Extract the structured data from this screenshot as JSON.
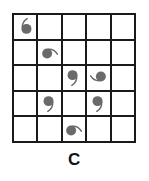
{
  "figure": {
    "caption": "C",
    "rows": 5,
    "cols": 5,
    "grid_line_color": "#1a1a1a",
    "glyph_color": "#6a6a6a",
    "background_color": "#ffffff"
  },
  "cells": [
    {
      "row": 1,
      "col": 1,
      "glyph": "comma-mark",
      "rotation": 180,
      "label": "comma rotated 180 degrees"
    },
    {
      "row": 1,
      "col": 2,
      "glyph": "",
      "rotation": 0,
      "label": "empty"
    },
    {
      "row": 1,
      "col": 3,
      "glyph": "",
      "rotation": 0,
      "label": "empty"
    },
    {
      "row": 1,
      "col": 4,
      "glyph": "",
      "rotation": 0,
      "label": "empty"
    },
    {
      "row": 1,
      "col": 5,
      "glyph": "",
      "rotation": 0,
      "label": "empty"
    },
    {
      "row": 2,
      "col": 1,
      "glyph": "",
      "rotation": 0,
      "label": "empty"
    },
    {
      "row": 2,
      "col": 2,
      "glyph": "comma-mark",
      "rotation": 270,
      "label": "comma rotated 270 degrees"
    },
    {
      "row": 2,
      "col": 3,
      "glyph": "",
      "rotation": 0,
      "label": "empty"
    },
    {
      "row": 2,
      "col": 4,
      "glyph": "",
      "rotation": 0,
      "label": "empty"
    },
    {
      "row": 2,
      "col": 5,
      "glyph": "",
      "rotation": 0,
      "label": "empty"
    },
    {
      "row": 3,
      "col": 1,
      "glyph": "",
      "rotation": 0,
      "label": "empty"
    },
    {
      "row": 3,
      "col": 2,
      "glyph": "",
      "rotation": 0,
      "label": "empty"
    },
    {
      "row": 3,
      "col": 3,
      "glyph": "comma-mark",
      "rotation": 0,
      "label": "comma upright"
    },
    {
      "row": 3,
      "col": 4,
      "glyph": "comma-mark",
      "rotation": 90,
      "label": "comma rotated 90 degrees"
    },
    {
      "row": 3,
      "col": 5,
      "glyph": "",
      "rotation": 0,
      "label": "empty"
    },
    {
      "row": 4,
      "col": 1,
      "glyph": "",
      "rotation": 0,
      "label": "empty"
    },
    {
      "row": 4,
      "col": 2,
      "glyph": "comma-mark",
      "rotation": 0,
      "label": "comma upright"
    },
    {
      "row": 4,
      "col": 3,
      "glyph": "",
      "rotation": 0,
      "label": "empty"
    },
    {
      "row": 4,
      "col": 4,
      "glyph": "comma-mark",
      "rotation": 0,
      "label": "comma upright"
    },
    {
      "row": 4,
      "col": 5,
      "glyph": "",
      "rotation": 0,
      "label": "empty"
    },
    {
      "row": 5,
      "col": 1,
      "glyph": "",
      "rotation": 0,
      "label": "empty"
    },
    {
      "row": 5,
      "col": 2,
      "glyph": "",
      "rotation": 0,
      "label": "empty"
    },
    {
      "row": 5,
      "col": 3,
      "glyph": "comma-mark",
      "rotation": 270,
      "label": "comma rotated 270 degrees"
    },
    {
      "row": 5,
      "col": 4,
      "glyph": "",
      "rotation": 0,
      "label": "empty"
    },
    {
      "row": 5,
      "col": 5,
      "glyph": "",
      "rotation": 0,
      "label": "empty"
    }
  ]
}
